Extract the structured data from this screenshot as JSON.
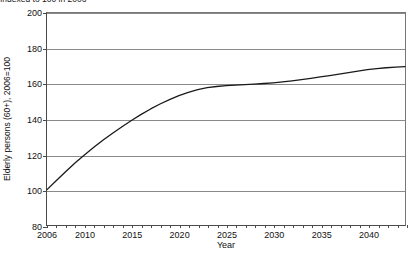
{
  "caption": {
    "text": "Indexed to 100 in 2006"
  },
  "chart_data": {
    "type": "line",
    "title": "",
    "subtitle": "Indexed to 100 in 2006",
    "xlabel": "Year",
    "ylabel": "Elderly persons (60+), 2006=100",
    "xlim": [
      2006,
      2044
    ],
    "ylim": [
      80,
      200
    ],
    "grid": true,
    "legend": false,
    "yticks": [
      80,
      100,
      120,
      140,
      160,
      180,
      200
    ],
    "ytick_labels": [
      "80",
      "100",
      "120",
      "140",
      "160",
      "180",
      "200"
    ],
    "xticks": [
      2006,
      2010,
      2015,
      2020,
      2025,
      2030,
      2035,
      2040
    ],
    "xtick_labels": [
      "2006",
      "2010",
      "2015",
      "2020",
      "2025",
      "2030",
      "2035",
      "2040"
    ],
    "xtick_minor_step": 1,
    "line_color": "#1a1a1a",
    "line_width": 1.3,
    "series": [
      {
        "name": "Elderly persons (60+) index",
        "x": [
          2006,
          2007,
          2008,
          2009,
          2010,
          2011,
          2012,
          2013,
          2014,
          2015,
          2016,
          2017,
          2018,
          2019,
          2020,
          2021,
          2022,
          2023,
          2024,
          2025,
          2026,
          2027,
          2028,
          2029,
          2030,
          2031,
          2032,
          2033,
          2034,
          2035,
          2036,
          2037,
          2038,
          2039,
          2040,
          2041,
          2042,
          2043,
          2044
        ],
        "values": [
          100.0,
          105.2,
          110.3,
          115.2,
          119.8,
          124.1,
          128.2,
          132.1,
          135.8,
          139.3,
          142.6,
          145.7,
          148.5,
          151.0,
          153.2,
          155.1,
          156.6,
          157.7,
          158.4,
          158.9,
          159.2,
          159.5,
          159.8,
          160.1,
          160.5,
          161.0,
          161.6,
          162.3,
          163.0,
          163.8,
          164.6,
          165.4,
          166.3,
          167.1,
          167.9,
          168.5,
          169.0,
          169.4,
          169.7
        ]
      }
    ]
  }
}
